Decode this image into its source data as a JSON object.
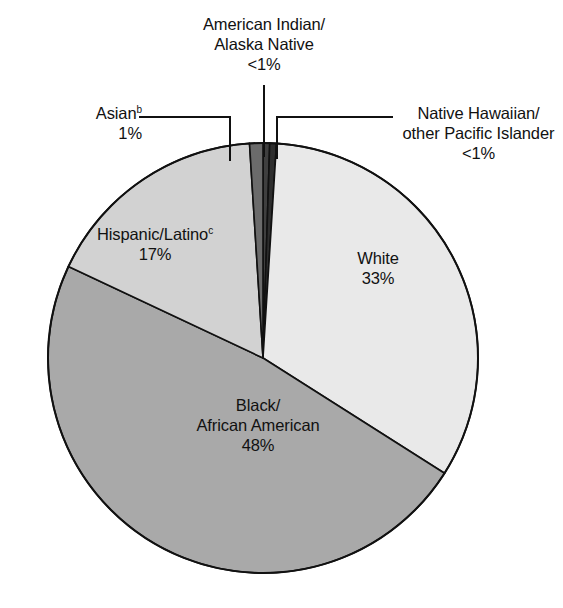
{
  "chart_data": {
    "type": "pie",
    "title": "",
    "legend_position": "none",
    "grid": false,
    "total_percent": 100,
    "categories": [
      "American Indian/Alaska Native",
      "Native Hawaiian/other Pacific Islander",
      "White",
      "Black/African American",
      "Hispanic/Latino",
      "Asian"
    ],
    "values": [
      0.5,
      0.5,
      33,
      48,
      17,
      1
    ],
    "labels_displayed": [
      "<1%",
      "<1%",
      "33%",
      "48%",
      "17%",
      "1%"
    ],
    "slices": [
      {
        "name": "American Indian/Alaska Native",
        "name_line1": "American Indian/",
        "name_line2": "Alaska Native",
        "value_label": "<1%",
        "value": 0.5,
        "color": "#3f3f3f",
        "label_placement": "callout-top",
        "footnote": ""
      },
      {
        "name": "Native Hawaiian/other Pacific Islander",
        "name_line1": "Native Hawaiian/",
        "name_line2": "other Pacific Islander",
        "value_label": "<1%",
        "value": 0.5,
        "color": "#2e2e2e",
        "label_placement": "callout-right",
        "footnote": ""
      },
      {
        "name": "White",
        "name_line1": "White",
        "value_label": "33%",
        "value": 33,
        "color": "#e9e9e9",
        "label_placement": "inside",
        "footnote": ""
      },
      {
        "name": "Black/African American",
        "name_line1": "Black/",
        "name_line2": "African American",
        "value_label": "48%",
        "value": 48,
        "color": "#a9a9a9",
        "label_placement": "inside",
        "footnote": ""
      },
      {
        "name": "Hispanic/Latino",
        "name_line1": "Hispanic/Latino",
        "value_label": "17%",
        "value": 17,
        "color": "#d2d2d2",
        "label_placement": "inside",
        "footnote": "c"
      },
      {
        "name": "Asian",
        "name_line1": "Asian",
        "value_label": "1%",
        "value": 1,
        "color": "#6b6b6b",
        "label_placement": "callout-left",
        "footnote": "b"
      }
    ],
    "stroke_color": "#111111",
    "background_color": "#ffffff"
  }
}
